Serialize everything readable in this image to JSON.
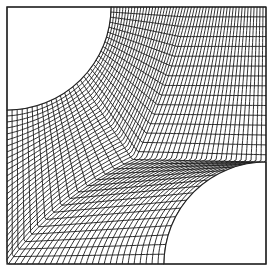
{
  "figure": {
    "type": "structured-curvilinear-mesh",
    "width": 273,
    "height": 271,
    "frame": {
      "x0": 7,
      "y0": 7,
      "x1": 266,
      "y1": 264
    },
    "holes": [
      {
        "name": "top-left-quarter-circle",
        "cx": 7,
        "cy": 7,
        "meets_top_x": 111,
        "meets_left_y": 110
      },
      {
        "name": "bottom-right-quarter-circle",
        "cx": 266,
        "cy": 264,
        "meets_right_y": 162,
        "meets_bottom_x": 164
      }
    ],
    "grid": {
      "xi_lines": 53,
      "eta_lines": 33
    },
    "colors": {
      "line": "#1a1a1a",
      "background": "#ffffff"
    }
  }
}
